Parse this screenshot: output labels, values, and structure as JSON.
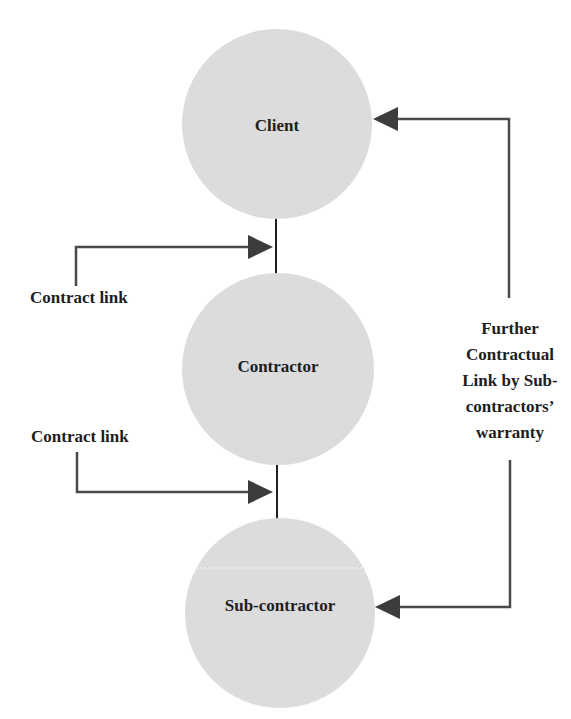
{
  "diagram": {
    "nodes": [
      {
        "id": "client",
        "label": "Client"
      },
      {
        "id": "contractor",
        "label": "Contractor"
      },
      {
        "id": "sub_contractor",
        "label": "Sub-contractor"
      }
    ],
    "contract_links": [
      {
        "label": "Contract link",
        "from": "client",
        "to": "contractor"
      },
      {
        "label": "Contract link",
        "from": "contractor",
        "to": "sub_contractor"
      }
    ],
    "warranty_link": {
      "label_lines": [
        "Further",
        "Contractual",
        "Link by Sub-",
        "contractors’",
        "warranty"
      ],
      "from": "sub_contractor",
      "to": "client"
    },
    "colors": {
      "node_fill": "#dcdcdc",
      "arrow": "#4a4a4a",
      "arrow_head": "#3c3c3c",
      "connector": "#1f1f1f",
      "text": "#1e1e1e"
    }
  }
}
